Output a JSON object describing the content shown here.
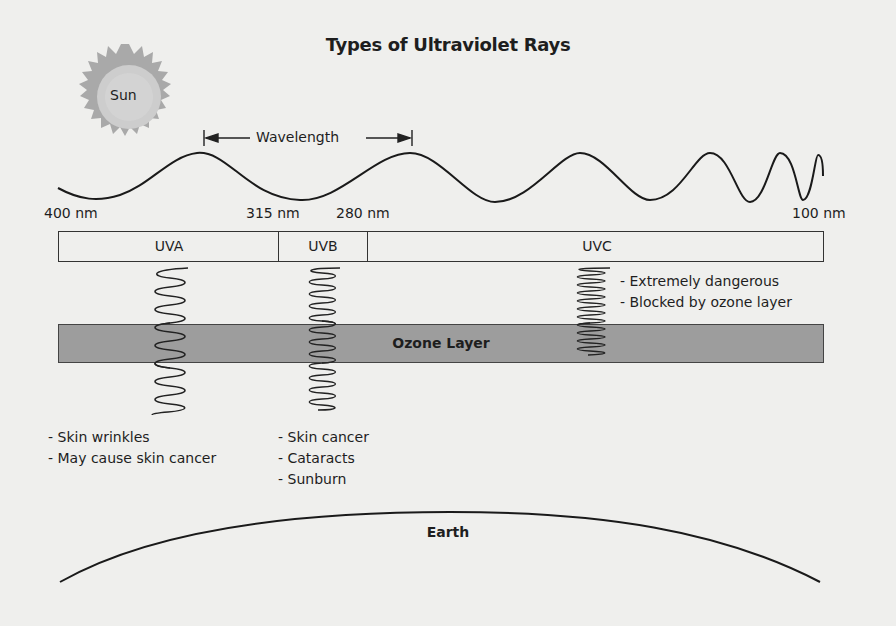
{
  "title": "Types of Ultraviolet Rays",
  "sun": {
    "label": "Sun",
    "colors": {
      "core": "#c9c9c9",
      "corona": "#a8a8a8"
    }
  },
  "wavelength": {
    "label": "Wavelength"
  },
  "scale": {
    "ticks": [
      "400 nm",
      "315 nm",
      "280 nm",
      "100 nm"
    ]
  },
  "bands": [
    {
      "name": "UVA",
      "range": "400–315 nm",
      "effects": [
        "- Skin wrinkles",
        "- May cause skin cancer"
      ]
    },
    {
      "name": "UVB",
      "range": "315–280 nm",
      "effects": [
        "- Skin cancer",
        "- Cataracts",
        "- Sunburn"
      ]
    },
    {
      "name": "UVC",
      "range": "280–100 nm",
      "effects": [
        "- Extremely dangerous",
        "- Blocked by ozone layer"
      ]
    }
  ],
  "ozone": {
    "label": "Ozone Layer",
    "color": "#9d9d9d"
  },
  "earth": {
    "label": "Earth"
  }
}
